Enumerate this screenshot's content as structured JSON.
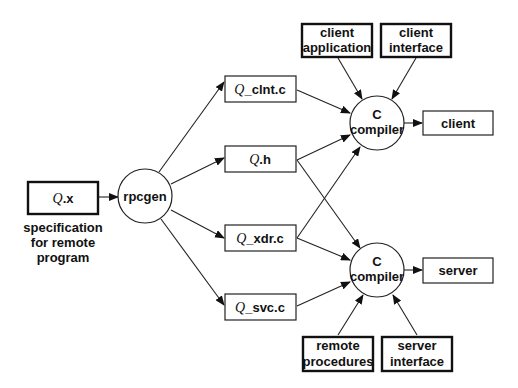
{
  "diagram": {
    "nodes": {
      "qx": {
        "italic": "Q",
        "suffix": ".x"
      },
      "qx_caption": [
        "specification",
        "for remote",
        "program"
      ],
      "rpcgen": "rpcgen",
      "clnt": {
        "italic": "Q",
        "suffix": "_clnt.c"
      },
      "h": {
        "italic": "Q",
        "suffix": ".h"
      },
      "xdr": {
        "italic": "Q",
        "suffix": "_xdr.c"
      },
      "svc": {
        "italic": "Q",
        "suffix": "_svc.c"
      },
      "cc_top": [
        "C",
        "compiler"
      ],
      "cc_bottom": [
        "C",
        "compiler"
      ],
      "client_app": [
        "client",
        "application"
      ],
      "client_iface": [
        "client",
        "interface"
      ],
      "client_out": "client",
      "server_out": "server",
      "remote_procs": [
        "remote",
        "procedures"
      ],
      "server_iface": [
        "server",
        "interface"
      ]
    },
    "edges": [
      [
        "Q.x",
        "rpcgen"
      ],
      [
        "rpcgen",
        "Q_clnt.c"
      ],
      [
        "rpcgen",
        "Q.h"
      ],
      [
        "rpcgen",
        "Q_xdr.c"
      ],
      [
        "rpcgen",
        "Q_svc.c"
      ],
      [
        "Q_clnt.c",
        "C compiler (client)"
      ],
      [
        "Q.h",
        "C compiler (client)"
      ],
      [
        "Q.h",
        "C compiler (server)"
      ],
      [
        "Q_xdr.c",
        "C compiler (client)"
      ],
      [
        "Q_xdr.c",
        "C compiler (server)"
      ],
      [
        "Q_svc.c",
        "C compiler (server)"
      ],
      [
        "client application",
        "C compiler (client)"
      ],
      [
        "client interface",
        "C compiler (client)"
      ],
      [
        "remote procedures",
        "C compiler (server)"
      ],
      [
        "server interface",
        "C compiler (server)"
      ],
      [
        "C compiler (client)",
        "client"
      ],
      [
        "C compiler (server)",
        "server"
      ]
    ]
  }
}
